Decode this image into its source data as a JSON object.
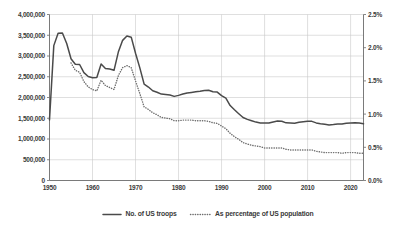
{
  "chart_data": {
    "type": "line",
    "title": "",
    "subtitle": "",
    "xlabel": "",
    "ylabel": "",
    "y2label": "",
    "grid": true,
    "legend_position": "bottom",
    "xlim": [
      1950,
      2023
    ],
    "ylim": [
      0,
      4000000
    ],
    "y2lim": [
      0,
      0.025
    ],
    "x_ticks": [
      1950,
      1960,
      1970,
      1980,
      1990,
      2000,
      2010,
      2020
    ],
    "x_tick_labels": [
      "1950",
      "1960",
      "1970",
      "1980",
      "1990",
      "2000",
      "2010",
      "2020"
    ],
    "y_ticks": [
      0,
      500000,
      1000000,
      1500000,
      2000000,
      2500000,
      3000000,
      3500000,
      4000000
    ],
    "y_tick_labels": [
      "0",
      "500,000",
      "1,000,000",
      "1,500,000",
      "2,000,000",
      "2,500,000",
      "3,000,000",
      "3,500,000",
      "4,000,000"
    ],
    "y2_ticks": [
      0,
      0.005,
      0.01,
      0.015,
      0.02,
      0.025
    ],
    "y2_tick_labels": [
      "0.0%",
      "0.5%",
      "1.0%",
      "1.5%",
      "2.0%",
      "2.5%"
    ],
    "x": [
      1950,
      1951,
      1952,
      1953,
      1954,
      1955,
      1956,
      1957,
      1958,
      1959,
      1960,
      1961,
      1962,
      1963,
      1964,
      1965,
      1966,
      1967,
      1968,
      1969,
      1970,
      1971,
      1972,
      1973,
      1974,
      1975,
      1976,
      1977,
      1978,
      1979,
      1980,
      1981,
      1982,
      1983,
      1984,
      1985,
      1986,
      1987,
      1988,
      1989,
      1990,
      1991,
      1992,
      1993,
      1994,
      1995,
      1996,
      1997,
      1998,
      1999,
      2000,
      2001,
      2002,
      2003,
      2004,
      2005,
      2006,
      2007,
      2008,
      2009,
      2010,
      2011,
      2012,
      2013,
      2014,
      2015,
      2016,
      2017,
      2018,
      2019,
      2020,
      2021,
      2022,
      2023
    ],
    "series": [
      {
        "name": "No. of US troops",
        "axis": "left",
        "style": "solid",
        "color": "#4a4a4a",
        "units": "troops",
        "values": [
          1460000,
          3250000,
          3550000,
          3555000,
          3300000,
          2935000,
          2800000,
          2795000,
          2600000,
          2505000,
          2476000,
          2483000,
          2808000,
          2700000,
          2687000,
          2655000,
          3094000,
          3377000,
          3480000,
          3454000,
          3066000,
          2714000,
          2322000,
          2252000,
          2162000,
          2128000,
          2082000,
          2074000,
          2062000,
          2027000,
          2051000,
          2083000,
          2109000,
          2123000,
          2138000,
          2151000,
          2169000,
          2174000,
          2138000,
          2130000,
          2044000,
          1986000,
          1807000,
          1705000,
          1610000,
          1518000,
          1472000,
          1439000,
          1407000,
          1386000,
          1384000,
          1385000,
          1412000,
          1434000,
          1427000,
          1389000,
          1385000,
          1380000,
          1402000,
          1418000,
          1430000,
          1425000,
          1388000,
          1369000,
          1354000,
          1340000,
          1348000,
          1359000,
          1359000,
          1379000,
          1385000,
          1390000,
          1385000,
          1365000
        ]
      },
      {
        "name": "As percentage of US population",
        "axis": "right",
        "style": "dotted",
        "color": "#6e6e6e",
        "units": "percent",
        "values": [
          null,
          null,
          null,
          null,
          null,
          0.0177,
          0.0166,
          0.0163,
          0.0149,
          0.0141,
          0.0137,
          0.0135,
          0.0151,
          0.0143,
          0.014,
          0.0137,
          0.0158,
          0.017,
          0.0173,
          0.017,
          0.015,
          0.0131,
          0.0111,
          0.0107,
          0.0102,
          0.0099,
          0.0095,
          0.0094,
          0.0093,
          0.009,
          0.009,
          0.0091,
          0.0091,
          0.0091,
          0.009,
          0.009,
          0.009,
          0.0089,
          0.0087,
          0.0086,
          0.0082,
          0.0078,
          0.0071,
          0.0066,
          0.0062,
          0.0057,
          0.0055,
          0.0053,
          0.0052,
          0.0051,
          0.0049,
          0.0049,
          0.0049,
          0.0049,
          0.0049,
          0.0047,
          0.0046,
          0.0046,
          0.0046,
          0.0046,
          0.0046,
          0.0046,
          0.0044,
          0.0043,
          0.0042,
          0.0042,
          0.0042,
          0.0042,
          0.0041,
          0.0042,
          0.0042,
          0.0042,
          0.0041,
          0.0041
        ]
      }
    ],
    "legend": [
      {
        "label": "No. of US troops",
        "style": "solid",
        "color": "#4a4a4a"
      },
      {
        "label": "As percentage of US population",
        "style": "dotted",
        "color": "#6e6e6e"
      }
    ]
  },
  "colors": {
    "background": "#ffffff",
    "grid": "#c9c9c9",
    "axis": "#6b6b6b",
    "text": "#3a3a3a",
    "series_solid": "#4a4a4a",
    "series_dotted": "#6e6e6e"
  }
}
